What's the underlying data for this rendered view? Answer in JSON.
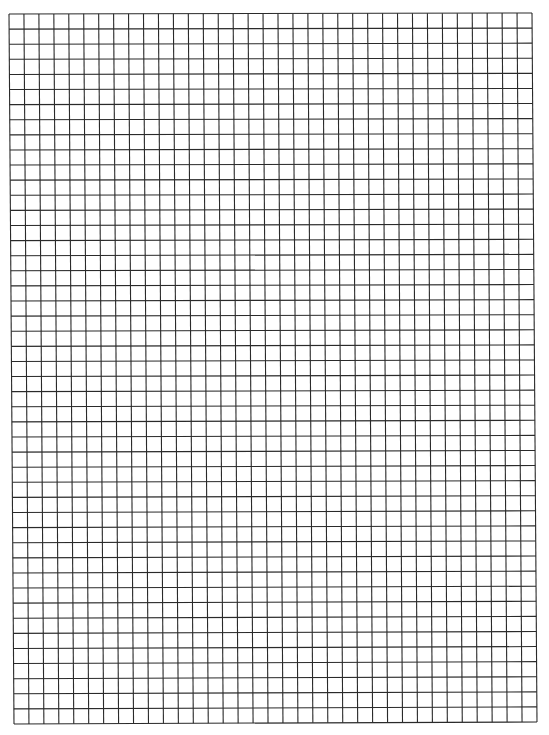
{
  "sheet": {
    "type": "graph-paper",
    "columns": 35,
    "rows": 47,
    "line_color": "#2a2a2a",
    "background": "#ffffff",
    "grid": {
      "top_left": [
        9,
        14
      ],
      "top_right": [
        532,
        13
      ],
      "bottom_left": [
        14,
        724
      ],
      "bottom_right": [
        537,
        722
      ]
    }
  }
}
